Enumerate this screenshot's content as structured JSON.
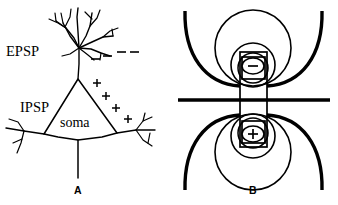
{
  "figure": {
    "caption_panels": [
      {
        "id": "A",
        "label": "A",
        "x": 78,
        "y": 194
      },
      {
        "id": "B",
        "label": "B",
        "x": 253,
        "y": 194
      }
    ]
  },
  "panel_a": {
    "name": "pyramidal-neuron-diagram",
    "labels": {
      "epsp": "EPSP",
      "ipsp": "IPSP",
      "soma": "soma"
    },
    "label_positions": {
      "epsp": {
        "x": 6,
        "y": 56
      },
      "ipsp": {
        "x": 20,
        "y": 112
      },
      "soma": {
        "x": 60,
        "y": 127
      }
    },
    "negative_charges": [
      {
        "x": 95,
        "y": 58,
        "width": 8
      },
      {
        "x": 107,
        "y": 55,
        "width": 9
      },
      {
        "x": 121,
        "y": 52,
        "width": 9
      },
      {
        "x": 133,
        "y": 52,
        "width": 9
      }
    ],
    "positive_charges": [
      {
        "x": 97,
        "y": 83
      },
      {
        "x": 106,
        "y": 96
      },
      {
        "x": 116,
        "y": 108
      },
      {
        "x": 128,
        "y": 118
      }
    ]
  },
  "panel_b": {
    "name": "dipole-field-diagram",
    "charge_top": {
      "sign": "−",
      "cx": 253,
      "cy": 66
    },
    "charge_bottom": {
      "sign": "+",
      "cx": 253,
      "cy": 135
    },
    "membrane_line_y": 100,
    "field_polarity": {
      "top": "negative",
      "bottom": "positive"
    }
  },
  "colors": {
    "ink": "#000000",
    "background": "#ffffff"
  }
}
